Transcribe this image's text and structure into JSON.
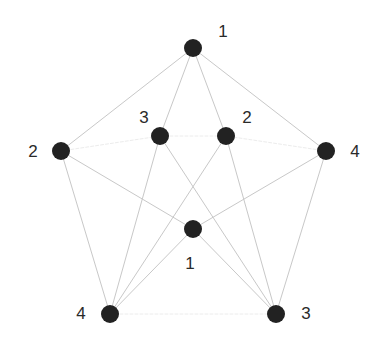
{
  "diagram": {
    "type": "graph",
    "canvas": {
      "width": 380,
      "height": 343,
      "background": "#ffffff"
    },
    "colors": {
      "node_fill": "#222222",
      "edge_stroke": "#c8c8c8",
      "edge_stroke_faint": "#ececec",
      "label_text": "#2a2a2a"
    },
    "node_radius": 9,
    "nodes": [
      {
        "id": "top",
        "label": "1",
        "x": 193,
        "y": 48,
        "label_x": 223,
        "label_y": 31
      },
      {
        "id": "left",
        "label": "2",
        "x": 61,
        "y": 151,
        "label_x": 33,
        "label_y": 151
      },
      {
        "id": "inner-left",
        "label": "3",
        "x": 160,
        "y": 136,
        "label_x": 144,
        "label_y": 117
      },
      {
        "id": "inner-right",
        "label": "2",
        "x": 226,
        "y": 136,
        "label_x": 247,
        "label_y": 117
      },
      {
        "id": "right",
        "label": "4",
        "x": 326,
        "y": 151,
        "label_x": 355,
        "label_y": 151
      },
      {
        "id": "center",
        "label": "1",
        "x": 193,
        "y": 229,
        "label_x": 190,
        "label_y": 263
      },
      {
        "id": "bottom-left",
        "label": "4",
        "x": 110,
        "y": 314,
        "label_x": 81,
        "label_y": 313
      },
      {
        "id": "bottom-right",
        "label": "3",
        "x": 276,
        "y": 314,
        "label_x": 306,
        "label_y": 313
      }
    ],
    "edges": [
      {
        "from": "top",
        "to": "left",
        "style": "normal"
      },
      {
        "from": "top",
        "to": "right",
        "style": "normal"
      },
      {
        "from": "top",
        "to": "inner-left",
        "style": "normal"
      },
      {
        "from": "top",
        "to": "inner-right",
        "style": "normal"
      },
      {
        "from": "left",
        "to": "bottom-left",
        "style": "normal"
      },
      {
        "from": "left",
        "to": "center",
        "style": "normal"
      },
      {
        "from": "left",
        "to": "inner-left",
        "style": "faint"
      },
      {
        "from": "right",
        "to": "bottom-right",
        "style": "normal"
      },
      {
        "from": "right",
        "to": "center",
        "style": "normal"
      },
      {
        "from": "right",
        "to": "inner-right",
        "style": "faint"
      },
      {
        "from": "inner-left",
        "to": "inner-right",
        "style": "faint"
      },
      {
        "from": "inner-left",
        "to": "bottom-left",
        "style": "normal"
      },
      {
        "from": "inner-left",
        "to": "bottom-right",
        "style": "normal"
      },
      {
        "from": "inner-right",
        "to": "bottom-left",
        "style": "normal"
      },
      {
        "from": "inner-right",
        "to": "bottom-right",
        "style": "normal"
      },
      {
        "from": "center",
        "to": "bottom-left",
        "style": "normal"
      },
      {
        "from": "center",
        "to": "bottom-right",
        "style": "normal"
      },
      {
        "from": "bottom-left",
        "to": "bottom-right",
        "style": "faint"
      }
    ]
  }
}
